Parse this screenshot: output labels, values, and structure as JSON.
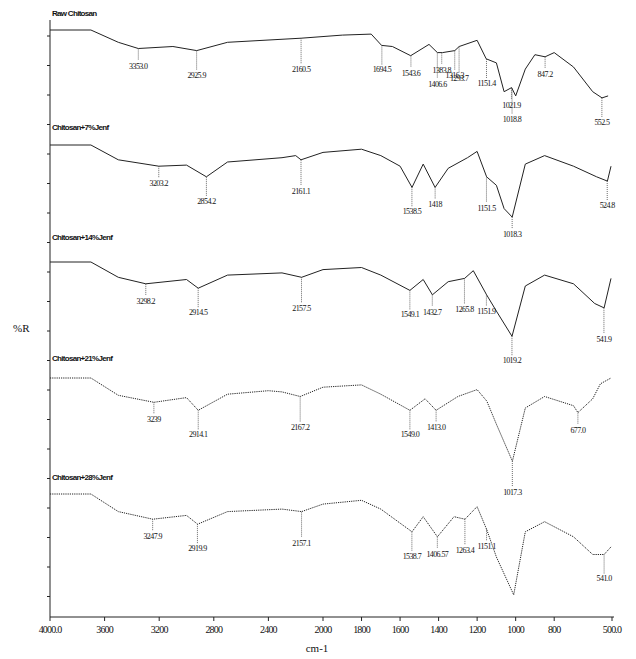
{
  "chart_data": {
    "type": "line",
    "title": "",
    "xlabel": "cm-1",
    "ylabel": "%R",
    "xlim": [
      4000,
      500
    ],
    "x_reversed": true,
    "x_ticks": [
      4000,
      3600,
      3200,
      2800,
      2400,
      2000,
      1800,
      1600,
      1400,
      1200,
      1000,
      800,
      500
    ],
    "x_tick_labels": [
      "4000.0",
      "3600",
      "3200",
      "2800",
      "2400",
      "2000",
      "1800",
      "1600",
      "1400",
      "1200",
      "1000",
      "800",
      "500.0"
    ],
    "grid": false,
    "layout": "stacked-offset",
    "series": [
      {
        "name": "Raw Chitosan",
        "style": "solid",
        "points": [
          [
            4000,
            100
          ],
          [
            3700,
            100
          ],
          [
            3500,
            88
          ],
          [
            3353,
            82
          ],
          [
            3100,
            84
          ],
          [
            2925,
            80
          ],
          [
            2700,
            88
          ],
          [
            2160,
            92
          ],
          [
            1900,
            95
          ],
          [
            1750,
            96
          ],
          [
            1696,
            85
          ],
          [
            1640,
            84
          ],
          [
            1545,
            75
          ],
          [
            1450,
            86
          ],
          [
            1406,
            78
          ],
          [
            1380,
            78
          ],
          [
            1316,
            80
          ],
          [
            1293,
            84
          ],
          [
            1200,
            90
          ],
          [
            1153,
            72
          ],
          [
            1100,
            68
          ],
          [
            1060,
            40
          ],
          [
            1021,
            44
          ],
          [
            1000,
            36
          ],
          [
            950,
            62
          ],
          [
            900,
            76
          ],
          [
            847,
            74
          ],
          [
            800,
            78
          ],
          [
            700,
            64
          ],
          [
            600,
            40
          ],
          [
            552,
            34
          ],
          [
            520,
            36
          ]
        ],
        "peaks": [
          {
            "x": 3353.0,
            "label": "3353.0"
          },
          {
            "x": 2925.9,
            "label": "2925.9"
          },
          {
            "x": 2160.5,
            "label": "2160.5"
          },
          {
            "x": 1694.5,
            "label": "1694.5"
          },
          {
            "x": 1543.6,
            "label": "1543.6"
          },
          {
            "x": 1406.6,
            "label": "1406.6"
          },
          {
            "x": 1383.8,
            "label": "1383.8"
          },
          {
            "x": 1316.3,
            "label": "1316.3"
          },
          {
            "x": 1293.7,
            "label": "1293.7"
          },
          {
            "x": 1151.4,
            "label": "1151.4"
          },
          {
            "x": 1021.9,
            "label": "1021.9"
          },
          {
            "x": 1018.8,
            "label": "1018.8"
          },
          {
            "x": 847.2,
            "label": "847.2"
          },
          {
            "x": 552.5,
            "label": "552.5"
          }
        ]
      },
      {
        "name": "Chitosan+7%Jenf",
        "style": "solid",
        "points": [
          [
            4000,
            100
          ],
          [
            3700,
            100
          ],
          [
            3500,
            86
          ],
          [
            3203,
            80
          ],
          [
            3000,
            81
          ],
          [
            2854,
            70
          ],
          [
            2700,
            84
          ],
          [
            2300,
            88
          ],
          [
            2200,
            90
          ],
          [
            2161,
            86
          ],
          [
            2000,
            93
          ],
          [
            1800,
            96
          ],
          [
            1700,
            90
          ],
          [
            1600,
            80
          ],
          [
            1538,
            60
          ],
          [
            1480,
            82
          ],
          [
            1418,
            60
          ],
          [
            1350,
            78
          ],
          [
            1250,
            88
          ],
          [
            1200,
            94
          ],
          [
            1151,
            70
          ],
          [
            1100,
            62
          ],
          [
            1060,
            40
          ],
          [
            1018,
            32
          ],
          [
            950,
            82
          ],
          [
            850,
            90
          ],
          [
            700,
            80
          ],
          [
            580,
            70
          ],
          [
            524,
            66
          ],
          [
            505,
            80
          ]
        ],
        "peaks": [
          {
            "x": 3203.2,
            "label": "3203.2"
          },
          {
            "x": 2854.2,
            "label": "2854.2"
          },
          {
            "x": 2161.1,
            "label": "2161.1"
          },
          {
            "x": 1538.5,
            "label": "1538.5"
          },
          {
            "x": 1418,
            "label": "1418"
          },
          {
            "x": 1151.5,
            "label": "1151.5"
          },
          {
            "x": 1018.3,
            "label": "1018.3"
          },
          {
            "x": 524.8,
            "label": "524.8"
          }
        ]
      },
      {
        "name": "Chitosan+14%Jenf",
        "style": "solid",
        "points": [
          [
            4000,
            100
          ],
          [
            3700,
            100
          ],
          [
            3500,
            86
          ],
          [
            3298,
            80
          ],
          [
            3000,
            84
          ],
          [
            2914,
            76
          ],
          [
            2700,
            88
          ],
          [
            2300,
            90
          ],
          [
            2157,
            86
          ],
          [
            2000,
            93
          ],
          [
            1800,
            95
          ],
          [
            1700,
            88
          ],
          [
            1549,
            74
          ],
          [
            1480,
            84
          ],
          [
            1432,
            70
          ],
          [
            1350,
            82
          ],
          [
            1265,
            85
          ],
          [
            1220,
            92
          ],
          [
            1151,
            70
          ],
          [
            1100,
            55
          ],
          [
            1019,
            32
          ],
          [
            950,
            78
          ],
          [
            850,
            88
          ],
          [
            700,
            80
          ],
          [
            590,
            62
          ],
          [
            541,
            58
          ],
          [
            505,
            85
          ]
        ],
        "peaks": [
          {
            "x": 3298.2,
            "label": "3298.2"
          },
          {
            "x": 2914.5,
            "label": "2914.5"
          },
          {
            "x": 2157.5,
            "label": "2157.5"
          },
          {
            "x": 1549.1,
            "label": "1549.1"
          },
          {
            "x": 1432.7,
            "label": "1432.7"
          },
          {
            "x": 1265.8,
            "label": "1265.8"
          },
          {
            "x": 1151.9,
            "label": "1151.9"
          },
          {
            "x": 1019.2,
            "label": "1019.2"
          },
          {
            "x": 541.9,
            "label": "541.9"
          }
        ]
      },
      {
        "name": "Chitosan+21%Jenf",
        "style": "dotted",
        "points": [
          [
            4000,
            100
          ],
          [
            3700,
            100
          ],
          [
            3500,
            85
          ],
          [
            3239,
            79
          ],
          [
            3000,
            83
          ],
          [
            2914,
            72
          ],
          [
            2700,
            86
          ],
          [
            2400,
            89
          ],
          [
            2300,
            88
          ],
          [
            2167,
            84
          ],
          [
            2000,
            92
          ],
          [
            1800,
            94
          ],
          [
            1700,
            86
          ],
          [
            1549,
            72
          ],
          [
            1470,
            82
          ],
          [
            1413,
            72
          ],
          [
            1300,
            84
          ],
          [
            1200,
            90
          ],
          [
            1150,
            80
          ],
          [
            1100,
            60
          ],
          [
            1017,
            28
          ],
          [
            950,
            74
          ],
          [
            850,
            84
          ],
          [
            700,
            76
          ],
          [
            677,
            70
          ],
          [
            600,
            82
          ],
          [
            560,
            95
          ],
          [
            505,
            100
          ]
        ],
        "peaks": [
          {
            "x": 3239,
            "label": "3239"
          },
          {
            "x": 2914.1,
            "label": "2914.1"
          },
          {
            "x": 2167.2,
            "label": "2167.2"
          },
          {
            "x": 1549.0,
            "label": "1549.0"
          },
          {
            "x": 1413.0,
            "label": "1413.0"
          },
          {
            "x": 1017.3,
            "label": "1017.3"
          },
          {
            "x": 677.0,
            "label": "677.0"
          }
        ]
      },
      {
        "name": "Chitosan+28%Jenf",
        "style": "dotted",
        "points": [
          [
            4000,
            100
          ],
          [
            3700,
            100
          ],
          [
            3500,
            86
          ],
          [
            3247,
            80
          ],
          [
            3000,
            83
          ],
          [
            2919,
            76
          ],
          [
            2700,
            86
          ],
          [
            2300,
            88
          ],
          [
            2157,
            86
          ],
          [
            2000,
            92
          ],
          [
            1800,
            95
          ],
          [
            1700,
            88
          ],
          [
            1538,
            70
          ],
          [
            1480,
            82
          ],
          [
            1406,
            66
          ],
          [
            1320,
            82
          ],
          [
            1263,
            80
          ],
          [
            1200,
            90
          ],
          [
            1151,
            72
          ],
          [
            1100,
            50
          ],
          [
            1010,
            20
          ],
          [
            950,
            70
          ],
          [
            850,
            78
          ],
          [
            700,
            66
          ],
          [
            600,
            52
          ],
          [
            541,
            52
          ],
          [
            505,
            58
          ]
        ],
        "peaks": [
          {
            "x": 3247.9,
            "label": "3247.9"
          },
          {
            "x": 2919.9,
            "label": "2919.9"
          },
          {
            "x": 2157.1,
            "label": "2157.1"
          },
          {
            "x": 1538.7,
            "label": "1538.7"
          },
          {
            "x": 1406.57,
            "label": "1406.57"
          },
          {
            "x": 1263.4,
            "label": "1263.4"
          },
          {
            "x": 1151.1,
            "label": "1151.1"
          },
          {
            "x": 541.0,
            "label": "541.0"
          }
        ]
      }
    ]
  }
}
